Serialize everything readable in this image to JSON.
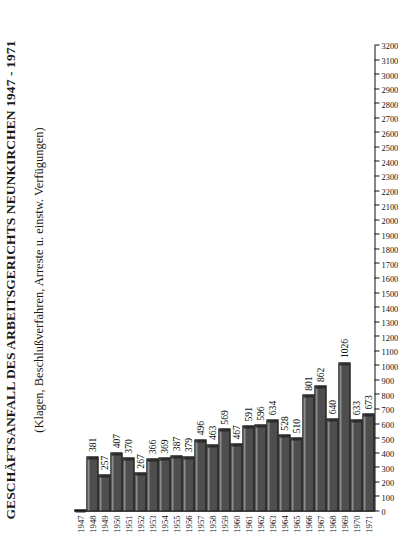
{
  "chart_data": {
    "type": "bar",
    "orientation": "horizontal",
    "title": "GESCHÄFTSANFALL DES ARBEITSGERICHTS NEUNKIRCHEN 1947 - 1971",
    "subtitle": "(Klagen, Beschlußverfahren, Arreste u. einstw. Verfügungen)",
    "xlabel": "",
    "ylabel": "",
    "grid": false,
    "legend": null,
    "value_axis": {
      "min": 0,
      "max": 3200,
      "step": 100,
      "ticks": [
        0,
        100,
        200,
        300,
        400,
        500,
        600,
        700,
        800,
        900,
        1000,
        1100,
        1200,
        1300,
        1400,
        1500,
        1600,
        1700,
        1800,
        1900,
        2000,
        2100,
        2200,
        2300,
        2400,
        2500,
        2600,
        2700,
        2800,
        2900,
        3000,
        3100,
        3200
      ],
      "tick_labels": [
        "0",
        "100",
        "200",
        "300",
        "400",
        "500",
        "600",
        "700",
        "800",
        "900",
        "1000",
        "1100",
        "1200",
        "1300",
        "1400",
        "1500",
        "1600",
        "1700",
        "1800",
        "1900",
        "2000",
        "2100",
        "2200",
        "2300",
        "2400",
        "2500",
        "2600",
        "2700",
        "2800",
        "2900",
        "3000",
        "3100",
        "3200"
      ]
    },
    "categories": [
      "1947",
      "1948",
      "1949",
      "1950",
      "1951",
      "1952",
      "1953",
      "1954",
      "1955",
      "1956",
      "1957",
      "1958",
      "1959",
      "1960",
      "1961",
      "1962",
      "1963",
      "1964",
      "1965",
      "1966",
      "1967",
      "1968",
      "1969",
      "1970",
      "1971"
    ],
    "values": [
      0,
      381,
      257,
      407,
      370,
      267,
      366,
      369,
      387,
      379,
      496,
      463,
      569,
      467,
      591,
      596,
      634,
      528,
      510,
      801,
      862,
      640,
      1026,
      633,
      673
    ],
    "value_labels": [
      "",
      "381",
      "257",
      "407",
      "370",
      "267",
      "366",
      "369",
      "387",
      "379",
      "496",
      "463",
      "569",
      "467",
      "591",
      "596",
      "634",
      "528",
      "510",
      "801",
      "862",
      "640",
      "1026",
      "633",
      "673"
    ],
    "bar_color": "#4e4e4e",
    "bar_edge_color": "#111111",
    "background_color": "#ffffff"
  }
}
